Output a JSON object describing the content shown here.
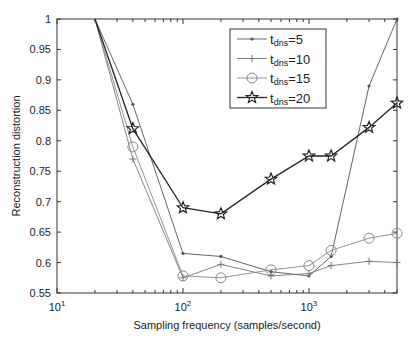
{
  "chart_data": {
    "type": "line",
    "title": "",
    "xlabel": "Sampling frequency (samples/second)",
    "ylabel": "Reconstruction distortion",
    "xscale": "log",
    "xlim": [
      10,
      5000
    ],
    "ylim": [
      0.55,
      1.0
    ],
    "xticks": [
      {
        "value": 10,
        "base": "10",
        "exp": "1"
      },
      {
        "value": 100,
        "base": "10",
        "exp": "2"
      },
      {
        "value": 1000,
        "base": "10",
        "exp": "3"
      }
    ],
    "yticks": [
      0.55,
      0.6,
      0.65,
      0.7,
      0.75,
      0.8,
      0.85,
      0.9,
      0.95,
      1
    ],
    "ytick_labels": [
      "0.55",
      "0.6",
      "0.65",
      "0.7",
      "0.75",
      "0.8",
      "0.85",
      "0.9",
      "0.95",
      "1"
    ],
    "grid": false,
    "legend_position": "upper center",
    "x": [
      20,
      40,
      100,
      200,
      500,
      1000,
      1500,
      3000,
      5000
    ],
    "series": [
      {
        "name": "t_dns=5",
        "sub": "dns",
        "value": "5",
        "marker": "dot",
        "color": "#555555",
        "values": [
          1.0,
          0.86,
          0.615,
          0.61,
          0.585,
          0.578,
          0.61,
          0.89,
          1.0
        ]
      },
      {
        "name": "t_dns=10",
        "sub": "dns",
        "value": "10",
        "marker": "plus",
        "color": "#777777",
        "values": [
          1.0,
          0.77,
          0.575,
          0.597,
          0.578,
          0.582,
          0.595,
          0.602,
          0.6
        ]
      },
      {
        "name": "t_dns=15",
        "sub": "dns",
        "value": "15",
        "marker": "circle",
        "color": "#888888",
        "values": [
          1.0,
          0.79,
          0.578,
          0.575,
          0.588,
          0.595,
          0.62,
          0.64,
          0.648
        ]
      },
      {
        "name": "t_dns=20",
        "sub": "dns",
        "value": "20",
        "marker": "star",
        "color": "#222222",
        "values": [
          1.0,
          0.82,
          0.69,
          0.68,
          0.737,
          0.775,
          0.775,
          0.822,
          0.862
        ]
      }
    ]
  }
}
